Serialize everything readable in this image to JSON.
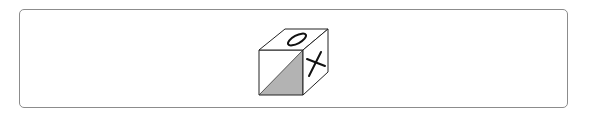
{
  "figure": {
    "faces": {
      "top": {
        "symbol": "O"
      },
      "right": {
        "symbol": "X"
      },
      "front": {
        "symbol": "",
        "shading": "lower-right diagonal half shaded"
      }
    },
    "colors": {
      "frame_border": "#8c8c8c",
      "edge": "#222222",
      "shade": "#b3b3b3",
      "background": "#ffffff"
    }
  }
}
